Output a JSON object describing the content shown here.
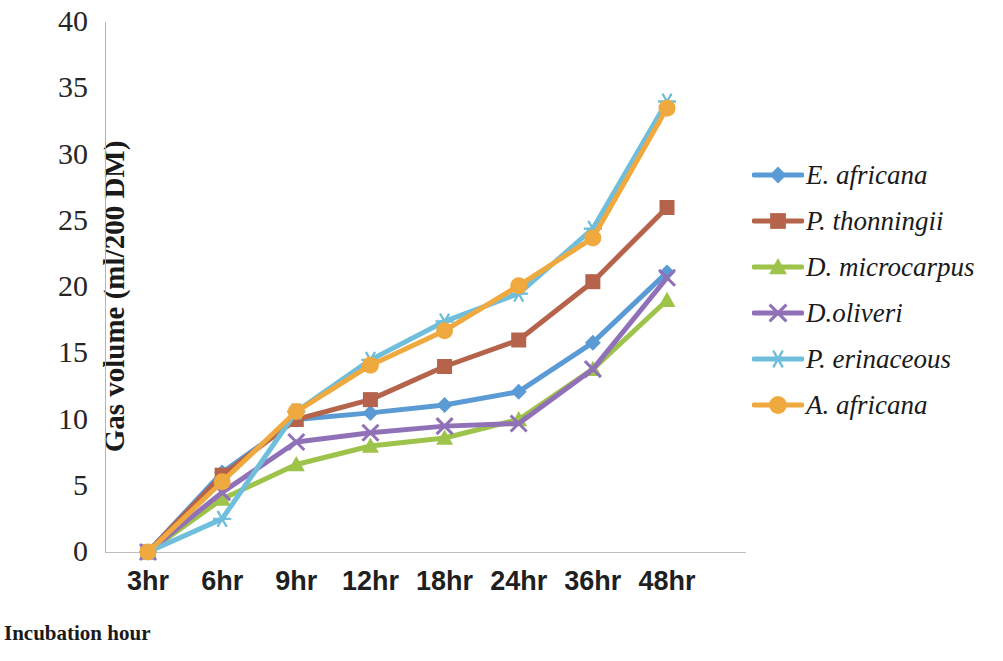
{
  "chart_data": {
    "type": "line",
    "title": "",
    "xlabel": "Incubation hour",
    "ylabel": "Gas volume (ml/200 DM)",
    "categories": [
      "3hr",
      "6hr",
      "9hr",
      "12hr",
      "18hr",
      "24hr",
      "36hr",
      "48hr"
    ],
    "yticks": [
      40,
      35,
      30,
      25,
      20,
      15,
      10,
      5,
      0
    ],
    "ylim": [
      0,
      40
    ],
    "grid": false,
    "legend_position": "right",
    "series": [
      {
        "name": "E. africana",
        "marker": "diamond",
        "color": "#5B9BD5",
        "values": [
          0,
          6.0,
          10.0,
          10.5,
          11.1,
          12.1,
          15.8,
          21.1
        ]
      },
      {
        "name": "P. thonningii",
        "marker": "square",
        "color": "#B5634A",
        "values": [
          0,
          5.8,
          10.0,
          11.5,
          14.0,
          16.0,
          20.4,
          26.0
        ]
      },
      {
        "name": "D. microcarpus",
        "marker": "triangle",
        "color": "#9DC34A",
        "values": [
          0,
          4.0,
          6.6,
          8.0,
          8.6,
          10.0,
          13.8,
          19.0
        ]
      },
      {
        "name": "D.oliveri",
        "marker": "x",
        "color": "#9071B8",
        "values": [
          0,
          4.5,
          8.3,
          9.0,
          9.5,
          9.7,
          13.8,
          20.7
        ]
      },
      {
        "name": "P. erinaceous",
        "marker": "asterisk",
        "color": "#6FBEDB",
        "values": [
          0,
          2.5,
          10.6,
          14.5,
          17.4,
          19.5,
          24.4,
          34.0
        ]
      },
      {
        "name": "A. africana",
        "marker": "circle",
        "color": "#F0A93E",
        "values": [
          0,
          5.3,
          10.6,
          14.1,
          16.7,
          20.1,
          23.7,
          33.5
        ]
      }
    ]
  }
}
